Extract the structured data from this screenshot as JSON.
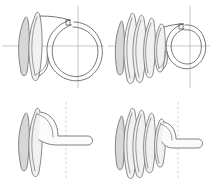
{
  "figure": {
    "background_color": "#ffffff",
    "wire_color": "#5d5d5d",
    "axis_color": "#b9b9b9",
    "shading_color": "#d7d7d7",
    "grid": {
      "rows": 2,
      "columns": 4
    }
  },
  "panels": [
    {
      "id": "panel-top-left",
      "name": "front-view-open-coil",
      "position": {
        "x": 0,
        "y": 0,
        "width": 106,
        "height": 94
      },
      "view_label": "front",
      "turns_visible": 2,
      "coil_diameter_px": 62,
      "axis": {
        "horizontal": true,
        "vertical": true,
        "style": "solid",
        "center_x": 78,
        "center_y": 46
      },
      "end_tab": {
        "present": true,
        "position": "upper-left-of-circle"
      }
    },
    {
      "id": "panel-top-right",
      "name": "front-view-compressed-coil",
      "position": {
        "x": 106,
        "y": 0,
        "width": 106,
        "height": 94
      },
      "view_label": "front",
      "turns_visible": 5,
      "coil_diameter_px": 44,
      "axis": {
        "horizontal": true,
        "vertical": true,
        "style": "solid",
        "center_x": 84,
        "center_y": 46
      },
      "end_tab": {
        "present": true,
        "position": "upper-left-of-circle"
      }
    },
    {
      "id": "panel-bottom-left",
      "name": "side-view-open-coil",
      "position": {
        "x": 0,
        "y": 94,
        "width": 106,
        "height": 93
      },
      "view_label": "side",
      "turns_visible": 2,
      "axis": {
        "horizontal": false,
        "vertical": true,
        "style": "dashed",
        "center_x": 66,
        "center_y": 46
      },
      "tail": {
        "present": true,
        "direction": "right",
        "capped": true
      }
    },
    {
      "id": "panel-bottom-right",
      "name": "side-view-compressed-coil",
      "position": {
        "x": 106,
        "y": 94,
        "width": 106,
        "height": 93
      },
      "view_label": "side",
      "turns_visible": 5,
      "axis": {
        "horizontal": false,
        "vertical": true,
        "style": "dashed",
        "center_x": 72,
        "center_y": 46
      },
      "tail": {
        "present": true,
        "direction": "right",
        "capped": true
      }
    }
  ]
}
